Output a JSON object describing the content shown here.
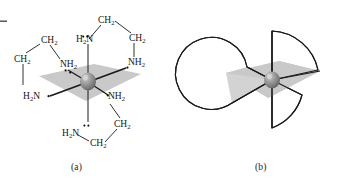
{
  "figure": {
    "panels": [
      {
        "id": "a",
        "caption": "(a)",
        "kind": "structural-formula",
        "description": "Octahedral metal center chelated by three ethylenediamine ligands, shown with a shaded equatorial plane.",
        "center_atom": {
          "name": "metal-center",
          "color": "#8c8c8c"
        },
        "plane": {
          "name": "coordination-plane",
          "color": "#c9c9c9"
        },
        "nitrogen_labels": [
          {
            "id": "n-plane-upper-left",
            "text": "NH",
            "sub": "2",
            "lone_pair": true
          },
          {
            "id": "n-plane-upper-right",
            "text": "NH",
            "sub": "2",
            "lone_pair": true
          },
          {
            "id": "n-plane-lower-left",
            "text": "H",
            "sub": "2",
            "text2": "N",
            "lone_pair": true
          },
          {
            "id": "n-plane-lower-right",
            "text": "NH",
            "sub": "2",
            "lone_pair": true
          },
          {
            "id": "n-axial-top",
            "text": "H",
            "sub": "2",
            "text2": "N",
            "lone_pair": true
          },
          {
            "id": "n-axial-bottom",
            "text": "H",
            "sub": "2",
            "text2": "N",
            "lone_pair": true
          }
        ],
        "carbon_labels": [
          {
            "id": "c-top-left",
            "text": "CH",
            "sub": "2"
          },
          {
            "id": "c-top-right",
            "text": "CH",
            "sub": "2"
          },
          {
            "id": "c-left-upper",
            "text": "CH",
            "sub": "2"
          },
          {
            "id": "c-left-lower",
            "text": "CH",
            "sub": "2"
          },
          {
            "id": "c-bottom-right",
            "text": "CH",
            "sub": "2"
          },
          {
            "id": "c-bottom-mid",
            "text": "CH",
            "sub": "2"
          }
        ],
        "ligand_count": 3,
        "ligand_name": "ethylenediamine"
      },
      {
        "id": "b",
        "caption": "(b)",
        "kind": "propeller-schematic",
        "description": "Three-bladed propeller abstraction of the same complex: shaded plane, central metal sphere, three curved chelate blades.",
        "center_atom": {
          "name": "metal-center",
          "color": "#8c8c8c"
        },
        "plane": {
          "name": "coordination-plane",
          "color": "#c9c9c9"
        },
        "blade_count": 3
      }
    ]
  },
  "labels": {
    "NH2": "NH",
    "H2N_h": "H",
    "H2N_n": "N",
    "CH2": "CH",
    "sub2": "2"
  },
  "colors": {
    "plane": "#c9c9c9",
    "plane_light": "#d6d6d6",
    "sphere_dark": "#6e6e6e",
    "sphere_mid": "#8f8f8f",
    "sphere_light": "#c2c2c2",
    "stroke": "#1a1a1a",
    "text": "#151515",
    "background": "#ffffff"
  }
}
